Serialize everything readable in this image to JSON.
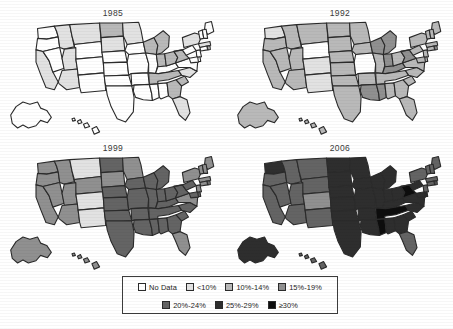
{
  "figure": {
    "background": "#ffffff"
  },
  "legend": {
    "name": "legend",
    "rows": [
      [
        {
          "label": "No Data",
          "color": "#ffffff"
        },
        {
          "label": "<10%",
          "color": "#e2e2e2"
        },
        {
          "label": "10%-14%",
          "color": "#b9b9b9"
        },
        {
          "label": "15%-19%",
          "color": "#909090"
        }
      ],
      [
        {
          "label": "20%-24%",
          "color": "#646464"
        },
        {
          "label": "25%-29%",
          "color": "#2e2e2e"
        },
        {
          "label": "≥30%",
          "color": "#0d0d0d"
        }
      ]
    ]
  },
  "panels": [
    {
      "year": "1985"
    },
    {
      "year": "1992"
    },
    {
      "year": "1999"
    },
    {
      "year": "2006"
    }
  ],
  "chart_data": {
    "type": "map",
    "subtype": "choropleth-series",
    "legend_position": "bottom-center",
    "categories": [
      "No Data",
      "<10%",
      "10%-14%",
      "15%-19%",
      "20%-24%",
      "25%-29%",
      "≥30%"
    ],
    "category_colors": [
      "#ffffff",
      "#e2e2e2",
      "#b9b9b9",
      "#909090",
      "#646464",
      "#2e2e2e",
      "#0d0d0d"
    ],
    "frames": [
      {
        "year": "1985",
        "values": {
          "AK": "No Data",
          "AL": "No Data",
          "AR": "No Data",
          "AZ": "<10%",
          "CA": "<10%",
          "CO": "No Data",
          "CT": "No Data",
          "DE": "No Data",
          "FL": "<10%",
          "GA": "10%-14%",
          "HI": "No Data",
          "IA": "No Data",
          "ID": "<10%",
          "IL": "No Data",
          "IN": "10%-14%",
          "KS": "No Data",
          "KY": "No Data",
          "LA": "No Data",
          "MA": "<10%",
          "MD": "No Data",
          "ME": "No Data",
          "MI": "10%-14%",
          "MN": "<10%",
          "MO": "No Data",
          "MS": "No Data",
          "MT": "<10%",
          "NC": "<10%",
          "ND": "10%-14%",
          "NE": "No Data",
          "NH": "No Data",
          "NJ": "No Data",
          "NM": "No Data",
          "NV": "No Data",
          "NY": "<10%",
          "OH": "10%-14%",
          "OK": "No Data",
          "OR": "No Data",
          "PA": "No Data",
          "RI": "<10%",
          "SC": "10%-14%",
          "SD": "<10%",
          "TN": "10%-14%",
          "TX": "No Data",
          "UT": "<10%",
          "VA": "No Data",
          "VT": "No Data",
          "WA": "No Data",
          "WI": "10%-14%",
          "WV": "10%-14%",
          "WY": "No Data"
        }
      },
      {
        "year": "1992",
        "values": {
          "AK": "10%-14%",
          "AL": "10%-14%",
          "AR": "10%-14%",
          "AZ": "10%-14%",
          "CA": "10%-14%",
          "CO": "<10%",
          "CT": "10%-14%",
          "DE": "10%-14%",
          "FL": "10%-14%",
          "GA": "10%-14%",
          "HI": "10%-14%",
          "IA": "10%-14%",
          "ID": "10%-14%",
          "IL": "10%-14%",
          "IN": "15%-19%",
          "KS": "10%-14%",
          "KY": "15%-19%",
          "LA": "15%-19%",
          "MA": "10%-14%",
          "MD": "10%-14%",
          "ME": "10%-14%",
          "MI": "15%-19%",
          "MN": "10%-14%",
          "MO": "No Data",
          "MS": "15%-19%",
          "MT": "10%-14%",
          "NC": "10%-14%",
          "ND": "10%-14%",
          "NE": "10%-14%",
          "NH": "10%-14%",
          "NJ": "10%-14%",
          "NM": "<10%",
          "NV": "10%-14%",
          "NY": "10%-14%",
          "OH": "10%-14%",
          "OK": "10%-14%",
          "OR": "10%-14%",
          "PA": "10%-14%",
          "RI": "10%-14%",
          "SC": "10%-14%",
          "SD": "10%-14%",
          "TN": "10%-14%",
          "TX": "10%-14%",
          "UT": "10%-14%",
          "VA": "10%-14%",
          "VT": "10%-14%",
          "WA": "<10%",
          "WI": "15%-19%",
          "WV": "15%-19%",
          "WY": "No Data"
        }
      },
      {
        "year": "1999",
        "values": {
          "AK": "15%-19%",
          "AL": "20%-24%",
          "AR": "20%-24%",
          "AZ": "15%-19%",
          "CA": "15%-19%",
          "CO": "<10%",
          "CT": "15%-19%",
          "DE": "20%-24%",
          "FL": "15%-19%",
          "GA": "20%-24%",
          "HI": "15%-19%",
          "IA": "20%-24%",
          "ID": "15%-19%",
          "IL": "20%-24%",
          "IN": "20%-24%",
          "KS": "20%-24%",
          "KY": "20%-24%",
          "LA": "20%-24%",
          "MA": "15%-19%",
          "MD": "20%-24%",
          "ME": "15%-19%",
          "MI": "20%-24%",
          "MN": "15%-19%",
          "MO": "20%-24%",
          "MS": "20%-24%",
          "MT": "<10%",
          "NC": "20%-24%",
          "ND": "20%-24%",
          "NE": "20%-24%",
          "NH": "15%-19%",
          "NJ": "15%-19%",
          "NM": "<10%",
          "NV": "15%-19%",
          "NY": "15%-19%",
          "OH": "20%-24%",
          "OK": "20%-24%",
          "OR": "15%-19%",
          "PA": "20%-24%",
          "RI": "15%-19%",
          "SC": "20%-24%",
          "SD": "15%-19%",
          "TN": "20%-24%",
          "TX": "20%-24%",
          "UT": "15%-19%",
          "VA": "15%-19%",
          "VT": "15%-19%",
          "WA": "15%-19%",
          "WI": "20%-24%",
          "WV": "20%-24%",
          "WY": "15%-19%"
        }
      },
      {
        "year": "2006",
        "values": {
          "AK": "25%-29%",
          "AL": "25%-29%",
          "AR": "25%-29%",
          "AZ": "20%-24%",
          "CA": "20%-24%",
          "CO": "15%-19%",
          "CT": "20%-24%",
          "DE": "25%-29%",
          "FL": "20%-24%",
          "GA": "25%-29%",
          "HI": "20%-24%",
          "IA": "25%-29%",
          "ID": "20%-24%",
          "IL": "25%-29%",
          "IN": "25%-29%",
          "KS": "25%-29%",
          "KY": "25%-29%",
          "LA": "25%-29%",
          "MA": "20%-24%",
          "MD": "25%-29%",
          "ME": "20%-24%",
          "MI": "25%-29%",
          "MN": "25%-29%",
          "MO": "25%-29%",
          "MS": "≥30%",
          "MT": "20%-24%",
          "NC": "25%-29%",
          "ND": "25%-29%",
          "NE": "25%-29%",
          "NH": "20%-24%",
          "NJ": "20%-24%",
          "NM": "20%-24%",
          "NV": "20%-24%",
          "NY": "20%-24%",
          "OH": "25%-29%",
          "OK": "25%-29%",
          "OR": "20%-24%",
          "PA": "25%-29%",
          "RI": "20%-24%",
          "SC": "25%-29%",
          "SD": "25%-29%",
          "TN": "≥30%",
          "TX": "25%-29%",
          "UT": "20%-24%",
          "VA": "25%-29%",
          "VT": "20%-24%",
          "WA": "25%-29%",
          "WI": "25%-29%",
          "WV": "≥30%",
          "WY": "20%-24%"
        }
      }
    ]
  }
}
